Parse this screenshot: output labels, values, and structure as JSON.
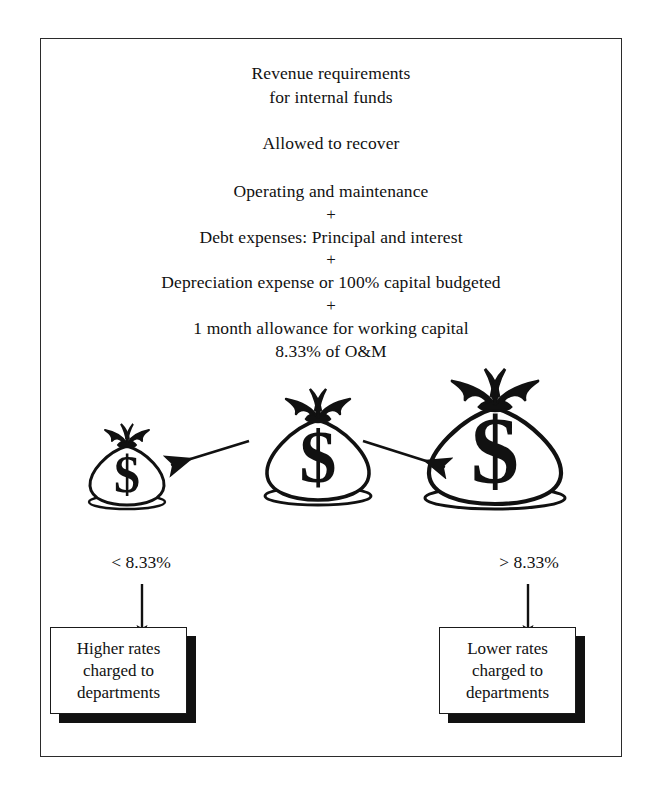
{
  "figure": {
    "title_lines": [
      "Revenue requirements",
      "for internal funds"
    ],
    "subtitle": "Allowed to recover",
    "formula_lines": [
      "Operating and maintenance",
      "+",
      "Debt expenses: Principal and interest",
      "+",
      "Depreciation expense or 100% capital budgeted",
      "+",
      "1 month allowance for working capital",
      "8.33% of O&M"
    ],
    "bags": [
      {
        "name": "small-money-bag",
        "symbol": "$",
        "size": "small"
      },
      {
        "name": "medium-money-bag",
        "symbol": "$",
        "size": "medium"
      },
      {
        "name": "large-money-bag",
        "symbol": "$",
        "size": "large"
      }
    ],
    "branch_labels": {
      "left": "< 8.33%",
      "right": "> 8.33%"
    },
    "outcomes": {
      "left": {
        "lines": [
          "Higher rates",
          "charged to",
          "departments"
        ]
      },
      "right": {
        "lines": [
          "Lower rates",
          "charged to",
          "departments"
        ]
      }
    },
    "colors": {
      "ink": "#111111",
      "frame": "#2b2b2b",
      "paper": "#ffffff",
      "shadow": "#111111"
    }
  }
}
